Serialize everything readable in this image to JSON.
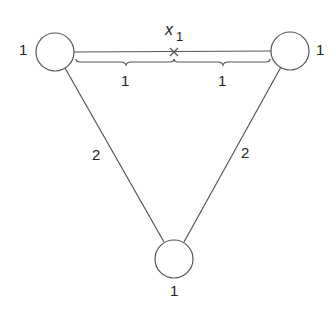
{
  "diagram": {
    "type": "weighted-graph",
    "nodes": [
      {
        "id": "left",
        "weight": "1",
        "cx": 55,
        "cy": 52,
        "r": 19
      },
      {
        "id": "right",
        "weight": "1",
        "cx": 290,
        "cy": 51,
        "r": 19
      },
      {
        "id": "bottom",
        "weight": "1",
        "cx": 174,
        "cy": 259,
        "r": 19
      }
    ],
    "edges": [
      {
        "from": "left",
        "to": "right",
        "length": "2",
        "split": [
          "1",
          "1"
        ]
      },
      {
        "from": "left",
        "to": "bottom",
        "length": "2"
      },
      {
        "from": "right",
        "to": "bottom",
        "length": "2"
      }
    ],
    "point": {
      "label": "x",
      "subscript": "1",
      "marker": "×"
    },
    "labels": {
      "left_weight": "1",
      "right_weight": "1",
      "bottom_weight": "1",
      "top_segment_left": "1",
      "top_segment_right": "1",
      "left_edge": "2",
      "right_edge": "2",
      "point_var": "x",
      "point_sub": "1"
    },
    "colors": {
      "stroke": "#555555",
      "text": "#222222",
      "background": "#ffffff"
    }
  }
}
